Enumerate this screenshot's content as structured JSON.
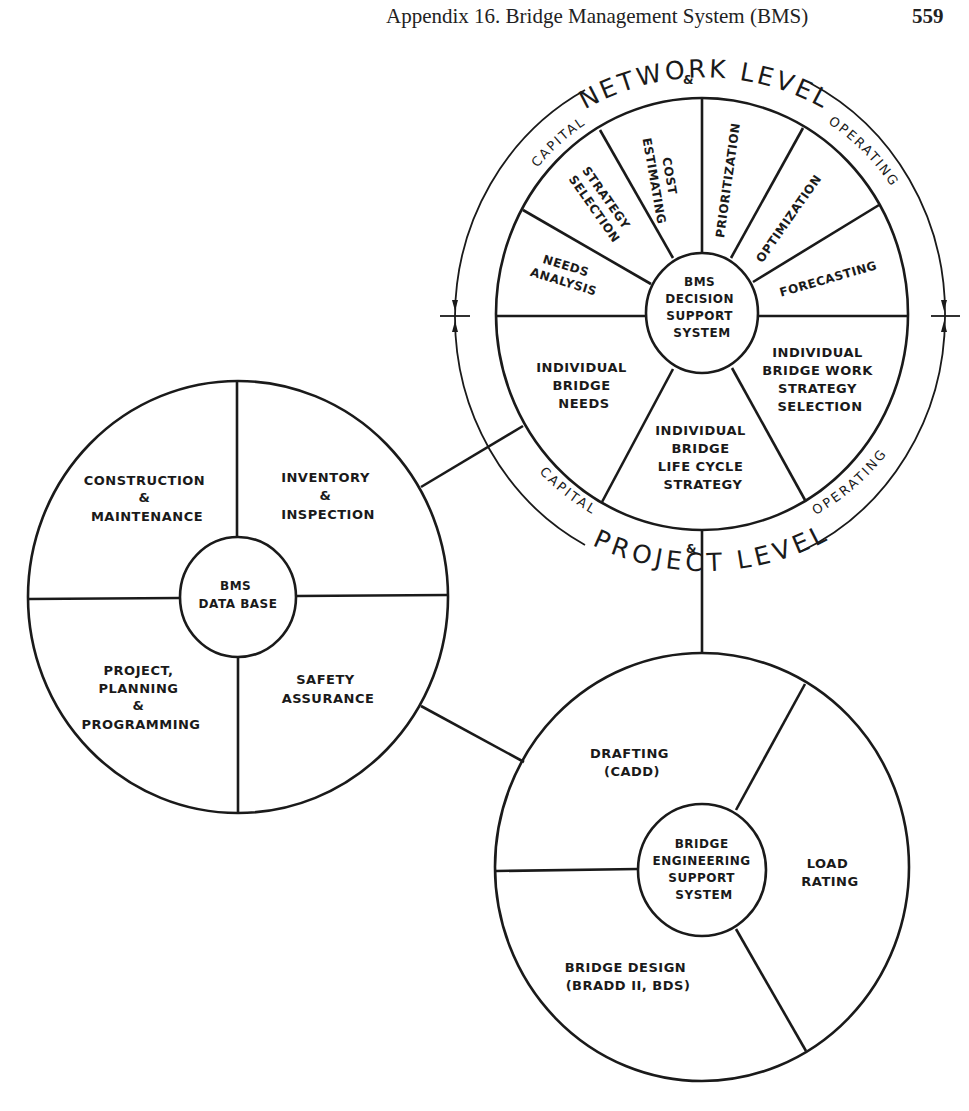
{
  "page_header": {
    "title": "Appendix 16.   Bridge Management System (BMS)",
    "page_number": "559"
  },
  "decision_support": {
    "hub": [
      "BMS",
      "DECISION",
      "SUPPORT",
      "SYSTEM"
    ],
    "outer_ring": {
      "top_title": "NETWORK LEVEL",
      "top_left": "CAPITAL",
      "top_amp": "&",
      "top_right": "OPERATING",
      "bottom_title": "PROJECT LEVEL",
      "bottom_left": "CAPITAL",
      "bottom_amp": "&",
      "bottom_right": "OPERATING"
    },
    "network_sectors": [
      {
        "lines": [
          "NEEDS",
          "ANALYSIS"
        ]
      },
      {
        "lines": [
          "STRATEGY",
          "SELECTION"
        ]
      },
      {
        "lines": [
          "COST",
          "ESTIMATING"
        ]
      },
      {
        "lines": [
          "PRIORITIZATION"
        ]
      },
      {
        "lines": [
          "OPTIMIZATION"
        ]
      },
      {
        "lines": [
          "FORECASTING"
        ]
      }
    ],
    "project_sectors": [
      {
        "lines": [
          "INDIVIDUAL",
          "BRIDGE",
          "NEEDS"
        ]
      },
      {
        "lines": [
          "INDIVIDUAL",
          "BRIDGE",
          "LIFE CYCLE",
          "STRATEGY"
        ]
      },
      {
        "lines": [
          "INDIVIDUAL",
          "BRIDGE WORK",
          "STRATEGY",
          "SELECTION"
        ]
      }
    ]
  },
  "database": {
    "hub": [
      "BMS",
      "DATA  BASE"
    ],
    "quadrants": [
      {
        "lines": [
          "CONSTRUCTION",
          "&",
          "MAINTENANCE"
        ]
      },
      {
        "lines": [
          "INVENTORY",
          "&",
          "INSPECTION"
        ]
      },
      {
        "lines": [
          "PROJECT,",
          "PLANNING",
          "&",
          "PROGRAMMING"
        ]
      },
      {
        "lines": [
          "SAFETY",
          "ASSURANCE"
        ]
      }
    ]
  },
  "engineering": {
    "hub": [
      "BRIDGE",
      "ENGINEERING",
      "SUPPORT",
      "SYSTEM"
    ],
    "sectors": [
      {
        "lines": [
          "DRAFTING",
          "(CADD)"
        ]
      },
      {
        "lines": [
          "LOAD",
          "RATING"
        ]
      },
      {
        "lines": [
          "BRIDGE  DESIGN",
          "(BRADD II, BDS)"
        ]
      }
    ]
  }
}
